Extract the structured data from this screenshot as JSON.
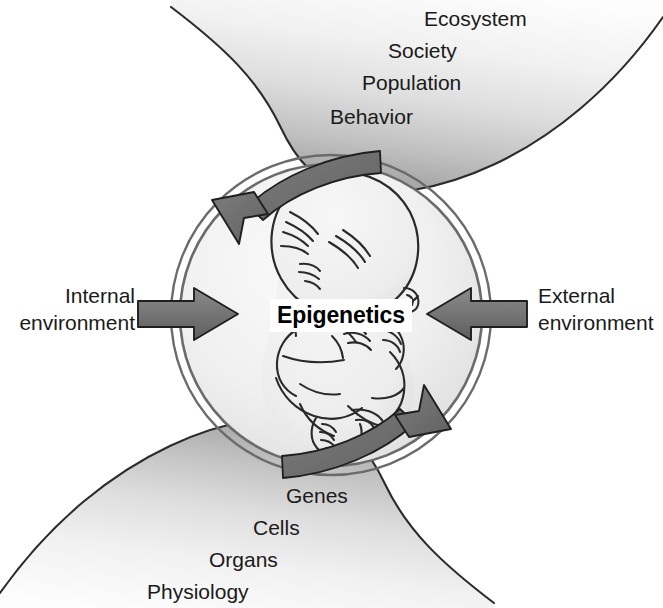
{
  "figure": {
    "center_label": "Epigenetics",
    "upper_ribbon_labels": [
      "Ecosystem",
      "Society",
      "Population",
      "Behavior"
    ],
    "lower_ribbon_labels": [
      "Genes",
      "Cells",
      "Organs",
      "Physiology"
    ],
    "left_label_line1": "Internal",
    "left_label_line2": "environment",
    "right_label_line1": "External",
    "right_label_line2": "environment",
    "colors": {
      "ink": "#1a1a1a",
      "arrow_gray": "#6e6e6e",
      "arrow_stroke": "#1a1a1a",
      "ribbon_light": "#fbfbfb",
      "ribbon_dark": "#b2b2b2",
      "circle_light": "#f3f3f3",
      "circle_shade": "#dcdcdc",
      "ring": "#5a5a5a",
      "background": "#ffffff"
    }
  }
}
